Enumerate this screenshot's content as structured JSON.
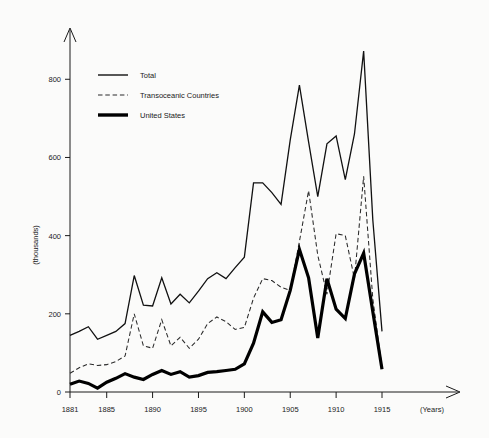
{
  "chart_data": {
    "type": "line",
    "title": "",
    "xlabel": "(Years)",
    "ylabel": "(thousands)",
    "xlim": [
      1881,
      1915
    ],
    "ylim": [
      0,
      880
    ],
    "grid": false,
    "legend_position": "top-left",
    "x": [
      1881,
      1882,
      1883,
      1884,
      1885,
      1886,
      1887,
      1888,
      1889,
      1890,
      1891,
      1892,
      1893,
      1894,
      1895,
      1896,
      1897,
      1898,
      1899,
      1900,
      1901,
      1902,
      1903,
      1904,
      1905,
      1906,
      1907,
      1908,
      1909,
      1910,
      1911,
      1912,
      1913,
      1914,
      1915
    ],
    "xticks": [
      1881,
      1885,
      1890,
      1895,
      1900,
      1905,
      1910,
      1915
    ],
    "xtick_labels": [
      "1881",
      "1885",
      "1890",
      "1895",
      "1900",
      "1905",
      "1910",
      "1915"
    ],
    "yticks": [
      0,
      200,
      400,
      600,
      800
    ],
    "ytick_labels": [
      "0",
      "200",
      "400",
      "600",
      "800"
    ],
    "series": [
      {
        "name": "Total",
        "style": "solid-thin",
        "values": [
          145,
          155,
          167,
          135,
          145,
          155,
          175,
          298,
          222,
          220,
          292,
          225,
          250,
          228,
          258,
          290,
          305,
          290,
          318,
          345,
          535,
          535,
          510,
          480,
          645,
          785,
          640,
          500,
          635,
          655,
          543,
          660,
          872,
          440,
          155
        ]
      },
      {
        "name": "Transoceanic Countries",
        "style": "dashed",
        "values": [
          48,
          62,
          72,
          68,
          70,
          78,
          92,
          200,
          118,
          112,
          185,
          118,
          140,
          112,
          135,
          175,
          192,
          180,
          160,
          165,
          240,
          290,
          285,
          268,
          260,
          385,
          515,
          350,
          250,
          405,
          400,
          290,
          552,
          238,
          62
        ]
      },
      {
        "name": "United States",
        "style": "solid-thick",
        "values": [
          20,
          28,
          22,
          10,
          25,
          35,
          47,
          38,
          32,
          45,
          55,
          45,
          52,
          38,
          42,
          50,
          52,
          55,
          58,
          72,
          125,
          205,
          178,
          185,
          260,
          365,
          292,
          138,
          290,
          212,
          188,
          302,
          355,
          205,
          58
        ]
      }
    ]
  },
  "legend": {
    "items": [
      {
        "label": "Total",
        "icon": "solid-line-icon"
      },
      {
        "label": "Transoceanic Countries",
        "icon": "dashed-line-icon"
      },
      {
        "label": "United States",
        "icon": "thick-line-icon"
      }
    ]
  },
  "axes": {
    "y_axis_title": "(thousands)",
    "x_axis_title": "(Years)"
  }
}
